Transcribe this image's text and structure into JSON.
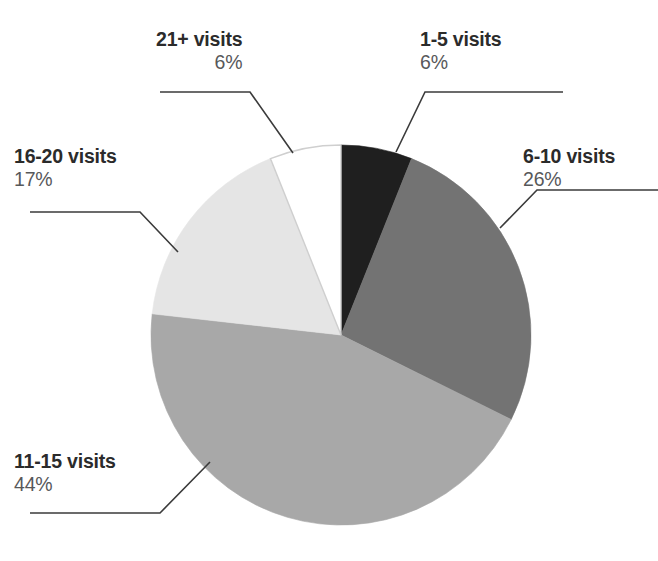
{
  "chart_data": {
    "type": "pie",
    "title": "",
    "subtitle": "",
    "xlabel": "",
    "ylabel": "",
    "legend_position": "callout-labels",
    "grid": false,
    "units": "percent",
    "total": 99,
    "start_angle_deg": 0,
    "direction": "clockwise",
    "categories": [
      "1-5 visits",
      "6-10 visits",
      "11-15 visits",
      "16-20 visits",
      "21+ visits"
    ],
    "values": [
      6,
      26,
      44,
      17,
      6
    ],
    "slices": [
      {
        "label": "1-5 visits",
        "value_text": "6%",
        "value": 6,
        "color": "#1f1f1f",
        "start_deg": 0,
        "end_deg": 21.8
      },
      {
        "label": "6-10 visits",
        "value_text": "26%",
        "value": 26,
        "color": "#737373",
        "start_deg": 21.8,
        "end_deg": 116.4
      },
      {
        "label": "11-15 visits",
        "value_text": "44%",
        "value": 44,
        "color": "#a8a8a8",
        "start_deg": 116.4,
        "end_deg": 276.4
      },
      {
        "label": "16-20 visits",
        "value_text": "17%",
        "value": 17,
        "color": "#e5e5e5",
        "start_deg": 276.4,
        "end_deg": 338.2
      },
      {
        "label": "21+ visits",
        "value_text": "6%",
        "value": 6,
        "color": "#ffffff",
        "start_deg": 338.2,
        "end_deg": 360
      }
    ],
    "geometry": {
      "center_x": 341,
      "center_y": 335,
      "radius": 190
    },
    "colors": {
      "slice_1_5": "#1f1f1f",
      "slice_6_10": "#737373",
      "slice_11_15": "#a8a8a8",
      "slice_16_20": "#e5e5e5",
      "slice_21plus": "#ffffff",
      "outline": "#cfcfcf",
      "leader_line": "#3b3b3b",
      "label_title": "#2b2b2b",
      "label_value": "#57585a",
      "background": "#ffffff"
    }
  },
  "labels": {
    "s1": {
      "title": "1-5 visits",
      "value": "6%"
    },
    "s2": {
      "title": "6-10 visits",
      "value": "26%"
    },
    "s3": {
      "title": "11-15 visits",
      "value": "44%"
    },
    "s4": {
      "title": "16-20 visits",
      "value": "17%"
    },
    "s5": {
      "title": "21+ visits",
      "value": "6%"
    }
  }
}
